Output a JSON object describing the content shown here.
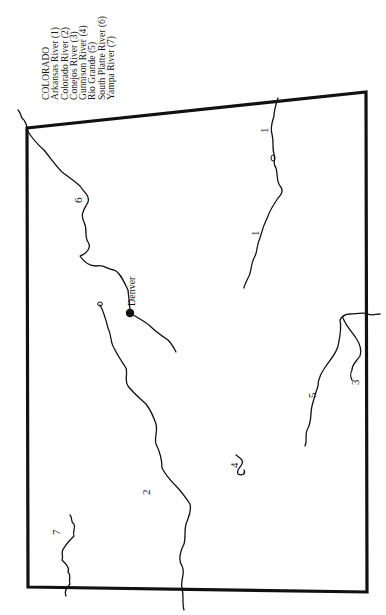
{
  "legend": {
    "title": "COLORADO",
    "items": [
      {
        "label": "Arkansas River (1)",
        "number": "1"
      },
      {
        "label": "Colorado River (2)",
        "number": "2"
      },
      {
        "label": "Conejos River (3)",
        "number": "3"
      },
      {
        "label": "Gunnison River (4)",
        "number": "4"
      },
      {
        "label": "Rio Grande (5)",
        "number": "5"
      },
      {
        "label": "South Platte River (6)",
        "number": "6"
      },
      {
        "label": "Yampa River (7)",
        "number": "7"
      }
    ]
  },
  "map": {
    "labels": {
      "arkansas_a": "1",
      "arkansas_b": "1",
      "colorado": "2",
      "conejos": "3",
      "gunnison": "4",
      "rio_grande": "5",
      "south_platte": "6",
      "yampa": "7"
    },
    "city": {
      "name": "Denver"
    },
    "colors": {
      "ink": "#111111",
      "paper": "#ffffff"
    }
  }
}
